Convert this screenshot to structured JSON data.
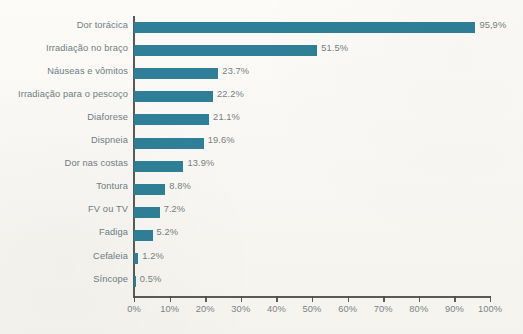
{
  "chart_data": {
    "type": "bar",
    "orientation": "horizontal",
    "title": "",
    "subtitle": "",
    "xlabel": "",
    "ylabel": "",
    "xlim": [
      0,
      100
    ],
    "grid": false,
    "legend": null,
    "categories": [
      "Dor torácica",
      "Irradiação no braço",
      "Náuseas e vômitos",
      "Irradiação para o pescoço",
      "Diaforese",
      "Dispneia",
      "Dor nas costas",
      "Tontura",
      "FV ou TV",
      "Fadiga",
      "Cefaleia",
      "Síncope"
    ],
    "values": [
      95.9,
      51.5,
      23.7,
      22.2,
      21.1,
      19.6,
      13.9,
      8.8,
      7.2,
      5.2,
      1.2,
      0.5
    ],
    "value_labels": [
      "95,9%",
      "51.5%",
      "23.7%",
      "22.2%",
      "21.1%",
      "19.6%",
      "13.9%",
      "8.8%",
      "7.2%",
      "5.2%",
      "1.2%",
      "0.5%"
    ],
    "xticks": [
      0,
      10,
      20,
      30,
      40,
      50,
      60,
      70,
      80,
      90,
      100
    ],
    "xtick_labels": [
      "0%",
      "10%",
      "20%",
      "30%",
      "40%",
      "50%",
      "60%",
      "70%",
      "80%",
      "90%",
      "100%"
    ],
    "colors": {
      "bar": "#2e7f97",
      "axis": "#4a4d49",
      "label_text": "#6f7d82",
      "tick_text": "#7b8486",
      "background": "#fbfaf7"
    }
  }
}
